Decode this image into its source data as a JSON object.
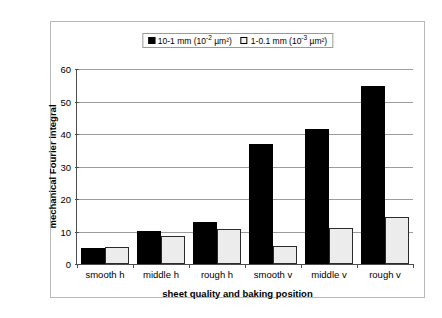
{
  "chart_data": {
    "type": "bar",
    "title": "",
    "xlabel": "sheet quality and baking position",
    "ylabel": "mechanical Fourier integral",
    "categories": [
      "smooth h",
      "middle h",
      "rough h",
      "smooth v",
      "middle v",
      "rough v"
    ],
    "series": [
      {
        "name": "10-1 mm (10-2 µm²)",
        "name_base": "10-1 mm (10",
        "name_exp": "-2",
        "name_tail": " µm²)",
        "marker": "filled-square",
        "color": "#000000",
        "values": [
          5.0,
          10.3,
          13.0,
          37.0,
          41.5,
          54.8
        ]
      },
      {
        "name": "1-0.1 mm (10-3 µm²)",
        "name_base": "1-0.1 mm (10",
        "name_exp": "-3",
        "name_tail": " µm²)",
        "marker": "open-square",
        "color": "#ececec",
        "values": [
          5.2,
          8.7,
          10.7,
          5.6,
          11.0,
          14.5
        ]
      }
    ],
    "ylim": [
      0,
      60
    ],
    "yticks": [
      0,
      10,
      20,
      30,
      40,
      50,
      60
    ],
    "ytick_labels": [
      "0",
      "10",
      "20",
      "30",
      "40",
      "50",
      "60"
    ],
    "grid": true,
    "legend_position": "top-center"
  }
}
